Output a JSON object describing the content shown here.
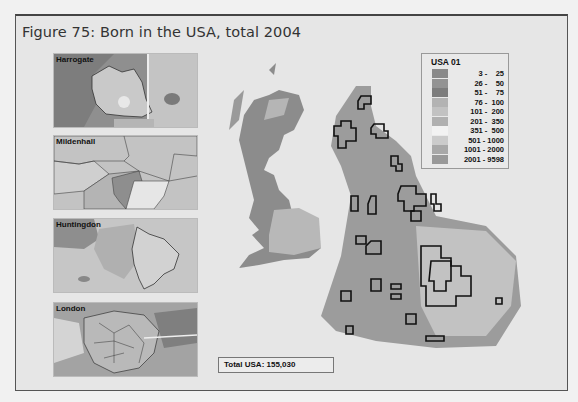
{
  "figure": {
    "title": "Figure 75: Born in the USA, total 2004"
  },
  "insets": [
    {
      "label": "Harrogate"
    },
    {
      "label": "Mildenhall"
    },
    {
      "label": "Huntingdon"
    },
    {
      "label": "London"
    }
  ],
  "legend": {
    "title": "USA 01",
    "classes": [
      {
        "range": "3 -    25",
        "color": "#8a8a8a"
      },
      {
        "range": "26 -    50",
        "color": "#939393"
      },
      {
        "range": "51 -    75",
        "color": "#7d7d7d"
      },
      {
        "range": "76 -  100",
        "color": "#b3b3b3"
      },
      {
        "range": "101 -  200",
        "color": "#c2c2c2"
      },
      {
        "range": "201 -  350",
        "color": "#b0b0b0"
      },
      {
        "range": "351 -  500",
        "color": "#f2f2f2"
      },
      {
        "range": "501 - 1000",
        "color": "#cbcbcb"
      },
      {
        "range": "1001 - 2000",
        "color": "#a8a8a8"
      },
      {
        "range": "2001 - 9598",
        "color": "#999999"
      }
    ]
  },
  "maps": {
    "geographic": {
      "label": "UK geographic map"
    },
    "cartogram": {
      "label": "UK population cartogram grid"
    }
  },
  "total": {
    "label": "Total USA: 155,030"
  }
}
